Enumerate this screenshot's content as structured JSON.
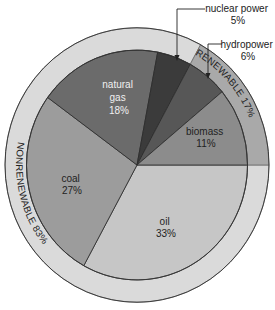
{
  "chart_data": {
    "type": "pie",
    "title": "",
    "start_angle_deg": 0,
    "direction": "clockwise",
    "slices": [
      {
        "label": "oil",
        "value": 33,
        "display": "33%",
        "color": "#c6c6c6",
        "text_color": "#222222",
        "group": "nonrenewable"
      },
      {
        "label": "coal",
        "value": 27,
        "display": "27%",
        "color": "#9c9c9c",
        "text_color": "#222222",
        "group": "nonrenewable"
      },
      {
        "label": "natural gas",
        "value": 18,
        "display": "18%",
        "color": "#6b6b6b",
        "text_color": "#f2f2f2",
        "group": "nonrenewable"
      },
      {
        "label": "nuclear power",
        "value": 5,
        "display": "5%",
        "color": "#3b3b3b",
        "text_color": "#222222",
        "group": "nonrenewable"
      },
      {
        "label": "hydropower",
        "value": 6,
        "display": "6%",
        "color": "#575757",
        "text_color": "#222222",
        "group": "renewable"
      },
      {
        "label": "biomass",
        "value": 11,
        "display": "11%",
        "color": "#8c8c8c",
        "text_color": "#222222",
        "group": "renewable"
      }
    ],
    "groups": [
      {
        "label": "NONRENEWABLE",
        "value": 83,
        "display": "NONRENEWABLE 83%",
        "color": "#dadada"
      },
      {
        "label": "RENEWABLE",
        "value": 17,
        "display": "RENEWABLE 17%",
        "color": "#a9a9a9"
      }
    ],
    "callouts": [
      {
        "slice": "nuclear power",
        "line1": "nuclear power",
        "line2": "5%"
      },
      {
        "slice": "hydropower",
        "line1": "hydropower",
        "line2": "6%"
      }
    ]
  },
  "labels": {
    "oil": {
      "name": "oil",
      "pct": "33%"
    },
    "coal": {
      "name": "coal",
      "pct": "27%"
    },
    "natural_gas": {
      "name1": "natural",
      "name2": "gas",
      "pct": "18%"
    },
    "biomass": {
      "name": "biomass",
      "pct": "11%"
    },
    "nuclear": {
      "name": "nuclear power",
      "pct": "5%"
    },
    "hydro": {
      "name": "hydropower",
      "pct": "6%"
    },
    "ring_nonrenewable": "NONRENEWABLE 83%",
    "ring_renewable": "RENEWABLE 17%"
  }
}
